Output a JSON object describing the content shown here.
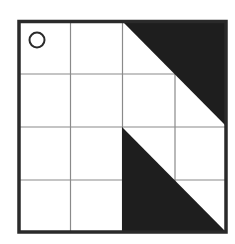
{
  "diagram": {
    "type": "grid-puzzle",
    "rows": 4,
    "cols": 4,
    "colors": {
      "background": "#ffffff",
      "border": "#2a2a2a",
      "grid_line": "#8a8a8a",
      "fill": "#1e1e1e"
    },
    "marker": {
      "shape": "circle",
      "cell": [
        0,
        0
      ]
    },
    "shaded_regions": [
      {
        "name": "top-right-triangle",
        "description": "Black right triangle spanning columns 2-3 of rows 0-1, hypotenuse from top of col 2 to right edge at row 1 bottom",
        "vertices_cells": [
          [
            0,
            2
          ],
          [
            0,
            4
          ],
          [
            2,
            4
          ]
        ]
      },
      {
        "name": "bottom-middle-triangle",
        "description": "Black right triangle spanning columns 2-3 of rows 2-3, right angle at bottom-left",
        "vertices_cells": [
          [
            2,
            2
          ],
          [
            4,
            2
          ],
          [
            4,
            4
          ]
        ]
      }
    ]
  }
}
